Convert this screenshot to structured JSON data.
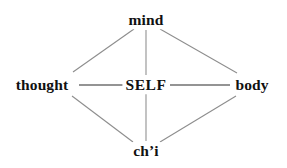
{
  "diagram": {
    "canvas": {
      "width": 287,
      "height": 168,
      "background": "#ffffff"
    },
    "colors": {
      "text": "#111111",
      "diagonal_edge": "#8d8d8d",
      "axis_edge": "#2b2b2b",
      "background": "#ffffff"
    },
    "nodes": [
      {
        "id": "mind",
        "label": "mind",
        "x": 146,
        "y": 20,
        "role": "top"
      },
      {
        "id": "thought",
        "label": "thought",
        "x": 42,
        "y": 85,
        "role": "left"
      },
      {
        "id": "self",
        "label": "SELF",
        "x": 146,
        "y": 85,
        "role": "center"
      },
      {
        "id": "body",
        "label": "body",
        "x": 252,
        "y": 85,
        "role": "right"
      },
      {
        "id": "chi",
        "label": "ch’i",
        "x": 146,
        "y": 151,
        "role": "bottom"
      }
    ],
    "edges": [
      {
        "id": "thought-mind",
        "from": "thought",
        "to": "mind",
        "style": "diagonal",
        "x1": 73,
        "y1": 72,
        "x2": 134,
        "y2": 29
      },
      {
        "id": "mind-body",
        "from": "mind",
        "to": "body",
        "style": "diagonal",
        "x1": 160,
        "y1": 29,
        "x2": 237,
        "y2": 73
      },
      {
        "id": "thought-chi",
        "from": "thought",
        "to": "chi",
        "style": "diagonal",
        "x1": 72,
        "y1": 96,
        "x2": 133,
        "y2": 142
      },
      {
        "id": "chi-body",
        "from": "chi",
        "to": "body",
        "style": "diagonal",
        "x1": 160,
        "y1": 142,
        "x2": 236,
        "y2": 96
      },
      {
        "id": "thought-self",
        "from": "thought",
        "to": "self",
        "style": "axis",
        "x1": 79,
        "y1": 85,
        "x2": 124,
        "y2": 85
      },
      {
        "id": "self-body",
        "from": "self",
        "to": "body",
        "style": "axis",
        "x1": 170,
        "y1": 85,
        "x2": 230,
        "y2": 85
      },
      {
        "id": "mind-self",
        "from": "mind",
        "to": "self",
        "style": "axis",
        "x1": 146,
        "y1": 30,
        "x2": 146,
        "y2": 75
      },
      {
        "id": "self-chi",
        "from": "self",
        "to": "chi",
        "style": "axis",
        "x1": 146,
        "y1": 94,
        "x2": 146,
        "y2": 141
      }
    ]
  }
}
